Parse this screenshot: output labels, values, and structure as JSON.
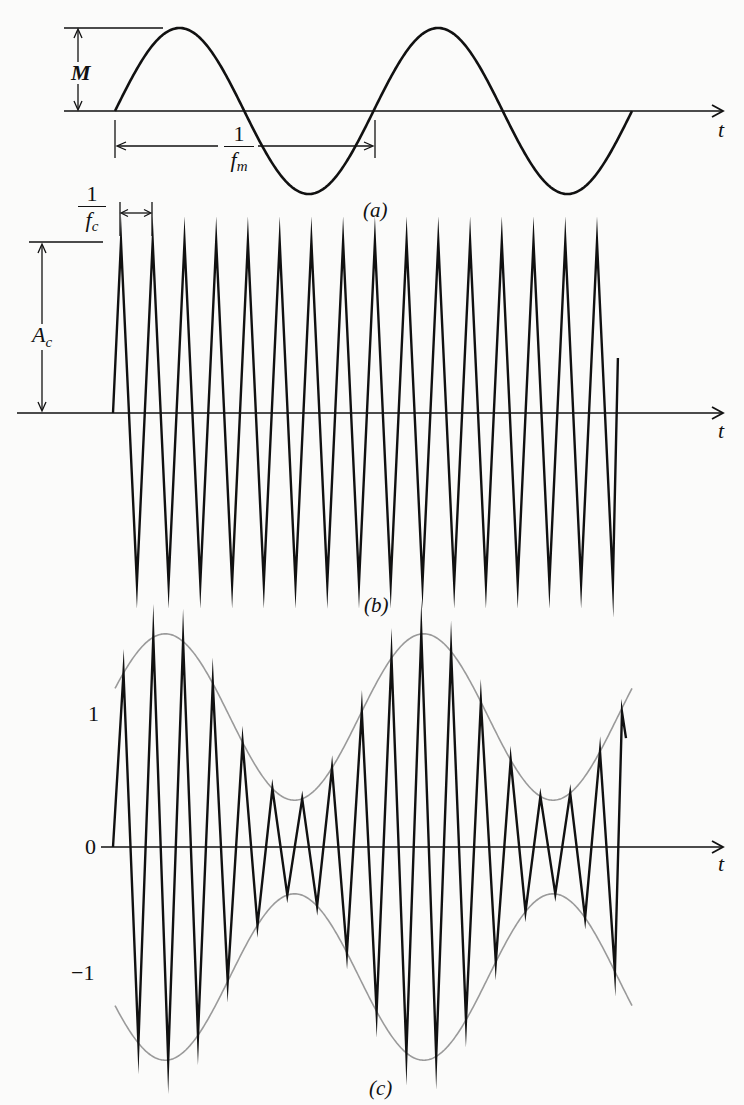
{
  "figure": {
    "panels": [
      {
        "id": "a",
        "caption": "(a)",
        "description": "Modulating sinusoid",
        "axis_label": "t",
        "amplitude_label": "M",
        "period_label": {
          "numerator": "1",
          "denominator": "f",
          "subscript": "m"
        }
      },
      {
        "id": "b",
        "caption": "(b)",
        "description": "Carrier waveform",
        "axis_label": "t",
        "amplitude_label": {
          "main": "A",
          "subscript": "c"
        },
        "period_label": {
          "numerator": "1",
          "denominator": "f",
          "subscript": "c"
        }
      },
      {
        "id": "c",
        "caption": "(c)",
        "description": "Amplitude-modulated waveform with envelope",
        "axis_label": "t",
        "y_ticks": [
          "1",
          "0",
          "−1"
        ]
      }
    ],
    "colors": {
      "signal": "#111111",
      "envelope": "#9a9a9a",
      "background": "#fbfbfa"
    }
  },
  "chart_data": [
    {
      "type": "line",
      "title": "(a)",
      "xlabel": "t",
      "ylabel": "",
      "series": [
        {
          "name": "modulating signal m(t) = M sin(2π f_m t)",
          "cycles": 2,
          "amplitude": "M"
        }
      ],
      "annotations": [
        "M (amplitude)",
        "1/f_m (period)"
      ]
    },
    {
      "type": "line",
      "title": "(b)",
      "xlabel": "t",
      "ylabel": "",
      "series": [
        {
          "name": "carrier c(t) = A_c cos(2π f_c t)",
          "cycles": 16,
          "amplitude": "A_c"
        }
      ],
      "annotations": [
        "A_c (amplitude)",
        "1/f_c (period)"
      ]
    },
    {
      "type": "line",
      "title": "(c)",
      "xlabel": "t",
      "ylabel": "",
      "yticks": [
        "1",
        "0",
        "-1"
      ],
      "ylim": [
        -1.6,
        1.6
      ],
      "series": [
        {
          "name": "AM signal [1 + m(t)] c(t)",
          "peak_values": [
            1.15,
            1.45,
            1.58,
            1.38,
            0.98,
            0.58,
            0.35,
            0.55,
            1.05,
            1.42,
            1.6,
            1.48,
            1.1,
            0.65,
            0.36,
            0.48,
            0.75
          ]
        },
        {
          "name": "envelope ±[1 + m(t)]",
          "max": 1.6,
          "min": 0.35
        }
      ]
    }
  ]
}
